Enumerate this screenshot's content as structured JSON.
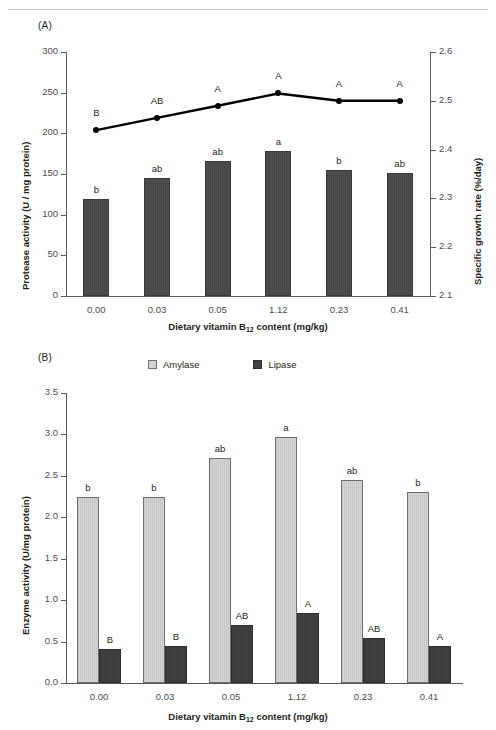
{
  "figure": {
    "panelA_label": "(A)",
    "panelB_label": "(B)"
  },
  "panelA": {
    "left_axis_title": "Protease activity (U / mg protein)",
    "right_axis_title": "Specific growth rate (%/day)",
    "x_axis_title_main": "Dietary vitamin B",
    "x_axis_title_sub": "12",
    "x_axis_title_tail": " content (mg/kg)",
    "left_ticks": [
      "0",
      "50",
      "100",
      "150",
      "200",
      "250",
      "300"
    ],
    "right_ticks": [
      "2.1",
      "2.2",
      "2.3",
      "2.4",
      "2.5",
      "2.6"
    ],
    "categories": [
      "0.00",
      "0.03",
      "0.05",
      "1.12",
      "0.23",
      "0.41"
    ],
    "bar_sig": [
      "b",
      "ab",
      "ab",
      "a",
      "b",
      "ab"
    ],
    "line_sig": [
      "B",
      "AB",
      "A",
      "A",
      "A",
      "A"
    ]
  },
  "panelB": {
    "y_axis_title": "Enzyme activity (U/mg protein)",
    "x_axis_title_main": "Dietary vitamin B",
    "x_axis_title_sub": "12",
    "x_axis_title_tail": " content (mg/kg)",
    "y_ticks": [
      "0.0",
      "0.5",
      "1.0",
      "1.5",
      "2.0",
      "2.5",
      "3.0",
      "3.5"
    ],
    "categories": [
      "0.00",
      "0.03",
      "0.05",
      "1.12",
      "0.23",
      "0.41"
    ],
    "legend": [
      {
        "label": "Amylase",
        "color": "#d3d3d3"
      },
      {
        "label": "Lipase",
        "color": "#414141"
      }
    ],
    "amylase_sig": [
      "b",
      "b",
      "ab",
      "a",
      "ab",
      "b"
    ],
    "lipase_sig": [
      "B",
      "B",
      "AB",
      "A",
      "AB",
      "A"
    ]
  },
  "chart_data": [
    {
      "type": "bar",
      "title": "(A)",
      "xlabel": "Dietary vitamin B12 content (mg/kg)",
      "categories": [
        "0.00",
        "0.03",
        "0.05",
        "1.12",
        "0.23",
        "0.41"
      ],
      "series": [
        {
          "name": "Protease activity",
          "kind": "bar",
          "axis": "left",
          "ylabel": "Protease activity (U / mg protein)",
          "ylim": [
            0,
            300
          ],
          "yticks": [
            0,
            50,
            100,
            150,
            200,
            250,
            300
          ],
          "values": [
            119,
            145,
            166,
            178,
            155,
            151
          ],
          "significance": [
            "b",
            "ab",
            "ab",
            "a",
            "b",
            "ab"
          ],
          "color": "#4f4f4f"
        },
        {
          "name": "Specific growth rate",
          "kind": "line",
          "axis": "right",
          "ylabel": "Specific growth rate (%/day)",
          "ylim": [
            2.1,
            2.6
          ],
          "yticks": [
            2.1,
            2.2,
            2.3,
            2.4,
            2.5,
            2.6
          ],
          "values": [
            2.44,
            2.465,
            2.49,
            2.515,
            2.5,
            2.5
          ],
          "significance": [
            "B",
            "AB",
            "A",
            "A",
            "A",
            "A"
          ],
          "color": "#000000"
        }
      ],
      "grid": false,
      "legend_position": "none"
    },
    {
      "type": "bar",
      "title": "(B)",
      "xlabel": "Dietary vitamin B12 content (mg/kg)",
      "ylabel": "Enzyme activity (U/mg protein)",
      "ylim": [
        0.0,
        3.5
      ],
      "yticks": [
        0.0,
        0.5,
        1.0,
        1.5,
        2.0,
        2.5,
        3.0,
        3.5
      ],
      "categories": [
        "0.00",
        "0.03",
        "0.05",
        "1.12",
        "0.23",
        "0.41"
      ],
      "series": [
        {
          "name": "Amylase",
          "values": [
            2.25,
            2.25,
            2.72,
            2.97,
            2.45,
            2.31
          ],
          "significance": [
            "b",
            "b",
            "ab",
            "a",
            "ab",
            "b"
          ],
          "color": "#d3d3d3"
        },
        {
          "name": "Lipase",
          "values": [
            0.41,
            0.45,
            0.7,
            0.85,
            0.54,
            0.45
          ],
          "significance": [
            "B",
            "B",
            "AB",
            "A",
            "AB",
            "A"
          ],
          "color": "#414141"
        }
      ],
      "grid": false,
      "legend_position": "top-center"
    }
  ]
}
